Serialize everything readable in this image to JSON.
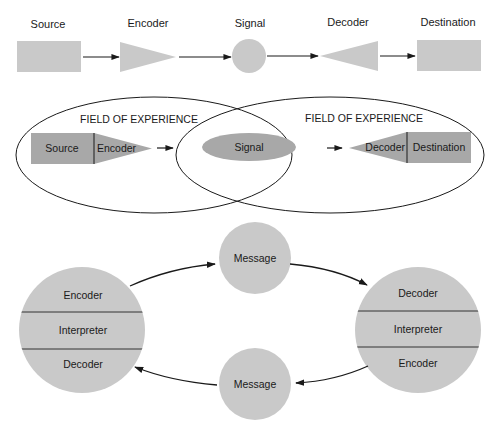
{
  "colors": {
    "light_fill": "#c9c9c9",
    "dark_fill": "#a8a8a8",
    "stroke": "#1a1a1a",
    "background": "#ffffff"
  },
  "linear_model": {
    "labels": [
      "Source",
      "Encoder",
      "Signal",
      "Decoder",
      "Destination"
    ]
  },
  "overlap_model": {
    "field_left": "FIELD OF EXPERIENCE",
    "field_right": "FIELD OF EXPERIENCE",
    "source": "Source",
    "encoder": "Encoder",
    "signal": "Signal",
    "decoder": "Decoder",
    "destination": "Destination"
  },
  "circular_model": {
    "left": {
      "top": "Encoder",
      "middle": "Interpreter",
      "bottom": "Decoder"
    },
    "right": {
      "top": "Decoder",
      "middle": "Interpreter",
      "bottom": "Encoder"
    },
    "message_top": "Message",
    "message_bottom": "Message"
  }
}
